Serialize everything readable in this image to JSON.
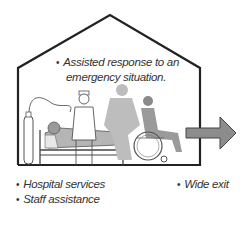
{
  "diagram": {
    "type": "illustration",
    "notes": {
      "top": {
        "line1": "Assisted response to an",
        "line2": "emergency situation."
      },
      "bottom_left": [
        "Hospital services",
        "Staff assistance"
      ],
      "bottom_right": [
        "Wide exit"
      ]
    },
    "bullet": "•",
    "elements": [
      "house-outline",
      "oxygen-tank",
      "hospital-bed",
      "patient",
      "nurse",
      "staff-member",
      "wheelchair-user",
      "exit-arrow"
    ],
    "colors": {
      "outline": "#222222",
      "figure_gray": "#9a9a9a",
      "light_gray": "#c8c8c8",
      "arrow": "#8c8c8c",
      "text": "#333333"
    }
  }
}
